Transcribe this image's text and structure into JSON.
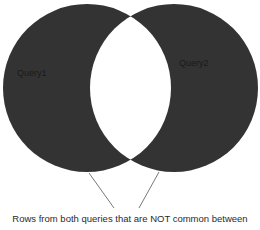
{
  "diagram": {
    "type": "venn",
    "style": {
      "fill_color": "#333333",
      "intersection_color": "#ffffff",
      "line_color": "#555555",
      "background": "#ffffff"
    },
    "sets": [
      {
        "id": "left",
        "label": "Query1",
        "cx": 87,
        "cy": 88,
        "r": 84
      },
      {
        "id": "right",
        "label": "Query2",
        "cx": 174,
        "cy": 88,
        "r": 84
      }
    ],
    "pointer_lines": [
      {
        "x1": 89,
        "y1": 173,
        "x2": 114,
        "y2": 208
      },
      {
        "x1": 159,
        "y1": 172,
        "x2": 139,
        "y2": 208
      }
    ],
    "caption": "Rows from both queries that are NOT common between"
  }
}
